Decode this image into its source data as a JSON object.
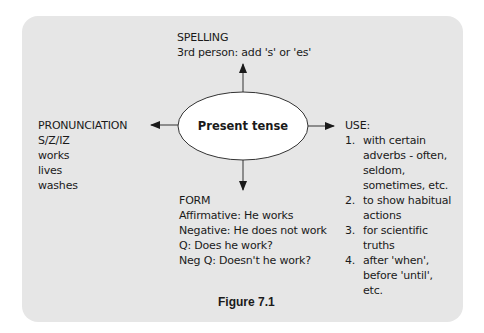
{
  "diagram": {
    "center": {
      "label": "Present tense"
    },
    "spelling": {
      "title": "SPELLING",
      "lines": [
        "3rd person: add 's' or 'es'"
      ]
    },
    "pronunciation": {
      "title": "PRONUNCIATION",
      "lines": [
        "S/Z/IZ",
        "works",
        "lives",
        "washes"
      ]
    },
    "form": {
      "title": "FORM",
      "lines": [
        "Affirmative: He works",
        "Negative: He does not work",
        "Q: Does he work?",
        "Neg Q: Doesn't he work?"
      ]
    },
    "use": {
      "title": "USE:",
      "items": [
        {
          "num": "1.",
          "lines": [
            "with certain",
            "adverbs - often,",
            "seldom,",
            "sometimes, etc."
          ]
        },
        {
          "num": "2.",
          "lines": [
            "to show habitual",
            "actions"
          ]
        },
        {
          "num": "3.",
          "lines": [
            "for scientific",
            "truths"
          ]
        },
        {
          "num": "4.",
          "lines": [
            "after 'when',",
            "before 'until',",
            "etc."
          ]
        }
      ]
    },
    "arrows": [
      "up",
      "down",
      "left",
      "right"
    ],
    "colors": {
      "panel_background": "#e6e6e6",
      "ellipse_fill": "#ffffff",
      "stroke": "#333333",
      "text": "#1a1a1a"
    }
  },
  "caption": "Figure 7.1"
}
